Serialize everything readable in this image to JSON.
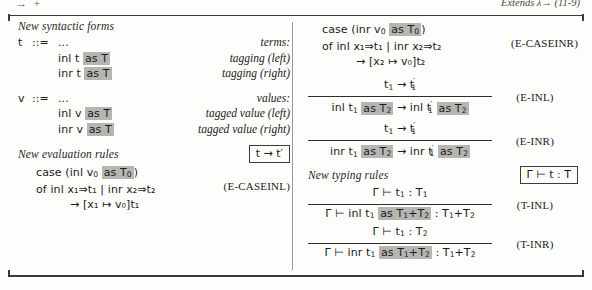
{
  "running_head": {
    "left": "→ +",
    "right": "Extends λ→ (11-9)"
  },
  "colors": {
    "highlight": "#b5b5b1",
    "rule_line": "#3a3a38",
    "text": "#1b1b1b"
  },
  "left_column": {
    "syntax_heading": "New syntactic forms",
    "terms_grammar": {
      "lhs": "t",
      "defeq": "::=",
      "first_rhs": "...",
      "category": "terms:",
      "rows": [
        {
          "body_pre": "inl t ",
          "body_hl": "as T",
          "label": "tagging (left)"
        },
        {
          "body_pre": "inr t ",
          "body_hl": "as T",
          "label": "tagging (right)"
        }
      ]
    },
    "values_grammar": {
      "lhs": "v",
      "defeq": "::=",
      "first_rhs": "...",
      "category": "values:",
      "rows": [
        {
          "body_pre": "inl v ",
          "body_hl": "as T",
          "label": "tagged value (left)"
        },
        {
          "body_pre": "inr v ",
          "body_hl": "as T",
          "label": "tagged value (right)"
        }
      ]
    },
    "eval_heading": "New evaluation rules",
    "eval_box_label": "t → t′",
    "eval_rule": {
      "name": "E-CASEINL",
      "line1_pre": "case (inl v",
      "line1_sub": "0",
      "line1_hl_pre": "as T",
      "line1_hl_sub": "0",
      "line1_post": ")",
      "line2": "of inl x₁⇒t₁ | inr x₂⇒t₂",
      "line3": "→ [x₁ ↦ v₀]t₁"
    }
  },
  "right_column": {
    "eval_rule_inr": {
      "name": "E-CASEINR",
      "line1_pre": "case (inr v",
      "line1_sub": "0",
      "line1_hl_pre": "as T",
      "line1_hl_sub": "0",
      "line1_post": ")",
      "line2": "of inl x₁⇒t₁ | inr x₂⇒t₂",
      "line3": "→ [x₂ ↦ v₀]t₂"
    },
    "e_inl": {
      "name": "E-INL",
      "numerator": "t₁ → t′₁",
      "denominator_parts": [
        "inl t",
        "1",
        " ",
        "as T",
        "2",
        " → inl t",
        "1",
        " ",
        "as T",
        "2"
      ]
    },
    "e_inr": {
      "name": "E-INR",
      "numerator": "t₁ → t′₁",
      "denominator_parts": [
        "inr t",
        "1",
        " ",
        "as T",
        "2",
        " → inr t",
        "1",
        " ",
        "as T",
        "2"
      ]
    },
    "typing_heading": "New typing rules",
    "typing_box_label": "Γ ⊢ t : T",
    "t_inl": {
      "name": "T-INL",
      "numerator": "Γ ⊢ t₁ : T₁",
      "denominator": "Γ ⊢ inl t₁ as T₁+T₂ : T₁+T₂"
    },
    "t_inr": {
      "name": "T-INR",
      "numerator": "Γ ⊢ t₁ : T₂",
      "denominator": "Γ ⊢ inr t₁ as T₁+T₂ : T₁+T₂"
    }
  }
}
